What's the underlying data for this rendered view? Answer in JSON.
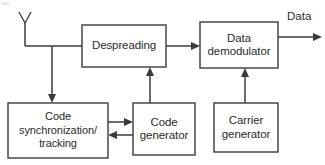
{
  "diagram": {
    "type": "block-diagram",
    "stroke_color": "#3b3b3b",
    "text_color": "#2b2b2b",
    "background_color": "#ffffff",
    "blocks": [
      {
        "id": "despreading",
        "label": "Despreading",
        "lines": [
          "Despreading"
        ]
      },
      {
        "id": "data_demodulator",
        "label": "Data demodulator",
        "lines": [
          "Data",
          "demodulator"
        ]
      },
      {
        "id": "code_synchronization_tracking",
        "label": "Code synchronization/ tracking",
        "lines": [
          "Code",
          "synchronization/",
          "tracking"
        ]
      },
      {
        "id": "code_generator",
        "label": "Code generator",
        "lines": [
          "Code",
          "generator"
        ]
      },
      {
        "id": "carrier_generator",
        "label": "Carrier generator",
        "lines": [
          "Carrier",
          "generator"
        ]
      }
    ],
    "signals": [
      {
        "id": "antenna_input",
        "label": "",
        "from": "antenna",
        "to": "despreading"
      },
      {
        "id": "antenna_to_sync",
        "label": "",
        "from": "antenna",
        "to": "code_synchronization_tracking"
      },
      {
        "id": "despread_to_demod",
        "label": "",
        "from": "despreading",
        "to": "data_demodulator"
      },
      {
        "id": "codegen_to_despread",
        "label": "",
        "from": "code_generator",
        "to": "despreading"
      },
      {
        "id": "carriergen_to_demod",
        "label": "",
        "from": "carrier_generator",
        "to": "data_demodulator"
      },
      {
        "id": "sync_to_codegen",
        "label": "",
        "from": "code_synchronization_tracking",
        "to": "code_generator"
      },
      {
        "id": "codegen_to_sync",
        "label": "",
        "from": "code_generator",
        "to": "code_synchronization_tracking"
      },
      {
        "id": "data_output",
        "label": "Data",
        "from": "data_demodulator",
        "to": "output"
      }
    ],
    "output_label": "Data",
    "antenna": {
      "name": "antenna-icon",
      "label": ""
    }
  }
}
